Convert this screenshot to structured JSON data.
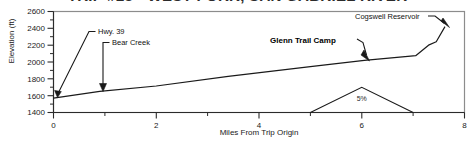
{
  "chart_data": {
    "type": "line",
    "title": "TRIP #23 - WEST FORK, SAN GABRIEL RIVER",
    "xlabel": "Miles From Trip Origin",
    "ylabel": "Elevation (ft)",
    "xlim": [
      0,
      8
    ],
    "ylim": [
      1400,
      2600
    ],
    "x_ticks": [
      0,
      2,
      4,
      6,
      8
    ],
    "x_tick_labels": [
      "0",
      "2",
      "4",
      "6",
      "8"
    ],
    "x_minor_ticks": [
      1,
      3,
      5,
      7
    ],
    "y_ticks": [
      1400,
      1600,
      1800,
      2000,
      2200,
      2400,
      2600
    ],
    "y_tick_labels": [
      "1400",
      "1600",
      "1800",
      "2000",
      "2200",
      "2400",
      "2600"
    ],
    "grid": false,
    "legend": "none",
    "series": [
      {
        "name": "Elevation profile",
        "x": [
          0.0,
          0.9,
          2.0,
          3.4,
          5.0,
          6.05,
          6.95,
          7.05,
          7.3,
          7.45,
          7.62
        ],
        "y": [
          1570,
          1650,
          1715,
          1830,
          1945,
          2020,
          2070,
          2075,
          2200,
          2240,
          2420
        ]
      },
      {
        "name": "5% grade indicator",
        "x": [
          5.0,
          6.0,
          7.0
        ],
        "y": [
          1400,
          1700,
          1400
        ]
      }
    ],
    "annotations": [
      {
        "text": "Hwy. 39",
        "point_x": 0.04,
        "point_y": 1575,
        "bold": false
      },
      {
        "text": "Bear Creek",
        "point_x": 0.9,
        "point_y": 1655,
        "bold": false
      },
      {
        "text": "Glenn Trail Camp",
        "point_x": 6.05,
        "point_y": 2020,
        "bold": true
      },
      {
        "text": "Cogswell Reservoir",
        "point_x": 7.62,
        "point_y": 2420,
        "bold": false
      },
      {
        "text": "5%",
        "point_x": 6.0,
        "point_y": 1540,
        "bold": false
      }
    ]
  },
  "colors": {
    "line": "#1a1a1a",
    "frame": "#8c8c8c",
    "axis": "#2b2b2b",
    "text": "#1a1a1a",
    "background": "#ffffff"
  }
}
